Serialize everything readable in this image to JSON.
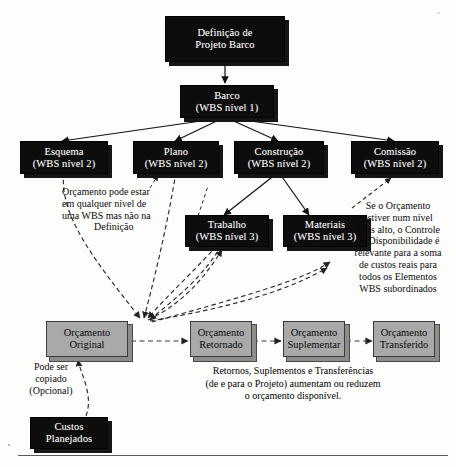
{
  "diagram": {
    "title_node": {
      "l1": "Definição de",
      "l2": "Projeto Barco"
    },
    "nodes": [
      {
        "id": "barco",
        "l1": "Barco",
        "l2": "(WBS nível 1)",
        "style": "dark"
      },
      {
        "id": "esquema",
        "l1": "Esquema",
        "l2": "(WBS nível 2)",
        "style": "dark"
      },
      {
        "id": "plano",
        "l1": "Plano",
        "l2": "(WBS nível 2)",
        "style": "dark"
      },
      {
        "id": "construcao",
        "l1": "Construção",
        "l2": "(WBS nível 2)",
        "style": "dark"
      },
      {
        "id": "comissao",
        "l1": "Comissão",
        "l2": "(WBS nível 2)",
        "style": "dark"
      },
      {
        "id": "trabalho",
        "l1": "Trabalho",
        "l2": "(WBS nível 3)",
        "style": "dark"
      },
      {
        "id": "materiais",
        "l1": "Materiais",
        "l2": "(WBS nível 3)",
        "style": "dark"
      },
      {
        "id": "orc-original",
        "l1": "Orçamento",
        "l2": "Original",
        "style": "gray"
      },
      {
        "id": "orc-retornado",
        "l1": "Orçamento",
        "l2": "Retornado",
        "style": "gray"
      },
      {
        "id": "orc-suplementar",
        "l1": "Orçamento",
        "l2": "Suplementar",
        "style": "gray"
      },
      {
        "id": "orc-transferido",
        "l1": "Orçamento",
        "l2": "Transferido",
        "style": "gray"
      },
      {
        "id": "custos-planejados",
        "l1": "Custos",
        "l2": "Planejados",
        "style": "dark"
      }
    ],
    "notes": {
      "budget_level": [
        "Orçamento pode estar",
        "em qualquer nível de",
        "uma WBS mas não na",
        "Definição"
      ],
      "availability_control": [
        "Se o Orçamento",
        "estiver num nível",
        "mais alto, o Controle",
        "de Disponibilidade é",
        "relevante para a soma",
        "de custos reais para",
        "todos os Elementos",
        "WBS subordinados"
      ],
      "copy_optional": [
        "Pode ser",
        "copiado",
        "(Opcional)"
      ],
      "bottom_caption": [
        "Retornos, Suplementos e Transferências",
        "(de e para o Projeto) aumentam ou reduzem",
        "o orçamento disponível."
      ]
    },
    "colors": {
      "node_dark": "#0d0d0d",
      "node_gray": "#a9a9a9",
      "line": "#1a1a1a",
      "background": "#fdfdfc"
    }
  }
}
